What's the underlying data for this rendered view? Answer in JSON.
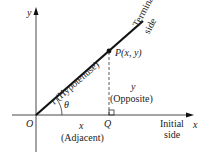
{
  "diagram": {
    "type": "right-triangle-trigonometry",
    "colors": {
      "line": "#111111",
      "axis": "#333333",
      "text": "#222222",
      "background": "#ffffff"
    },
    "axes": {
      "x_label": "x",
      "y_label": "y"
    },
    "origin_label": "O",
    "angle_label": "θ",
    "point_label": "P(x, y)",
    "foot_label": "Q",
    "hypotenuse_label": "r (Hypotenuse)",
    "terminal_side_label": [
      "Terminal",
      "side"
    ],
    "initial_side_label": [
      "Initial",
      "side"
    ],
    "adjacent": {
      "var": "x",
      "desc": "(Adjacent)"
    },
    "opposite": {
      "var": "y",
      "desc": "(Opposite)"
    }
  }
}
